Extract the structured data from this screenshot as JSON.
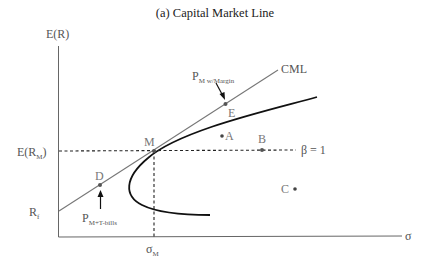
{
  "title": "(a) Capital Market Line",
  "axes": {
    "y_label": "E(R)",
    "x_label": "σ",
    "y_ticks": {
      "market_return": "E(R",
      "market_return_sub": "M",
      "market_return_close": ")",
      "risk_free": "R",
      "risk_free_sub": "f"
    },
    "x_ticks": {
      "market_sigma": "σ",
      "market_sigma_sub": "M"
    }
  },
  "lines": {
    "cml_label": "CML",
    "beta_label": "β = 1"
  },
  "points": {
    "M": "M",
    "A": "A",
    "B": "B",
    "C": "C",
    "D": "D",
    "E": "E"
  },
  "annotations": {
    "margin_portfolio": {
      "main": "P",
      "sub": "M w/Margin"
    },
    "tbill_portfolio": {
      "main": "P",
      "sub": "M+T-bills"
    }
  },
  "colors": {
    "axis": "#666666",
    "cml": "#777777",
    "frontier": "#111111",
    "dotted": "#222222",
    "point": "#555555"
  }
}
